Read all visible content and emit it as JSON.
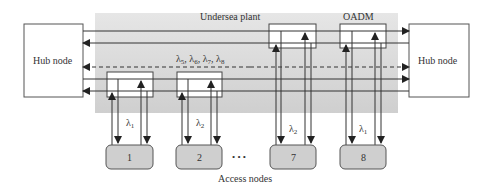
{
  "diagram": {
    "region_label": "Undersea plant",
    "oadm_label": "OADM",
    "hub_left": "Hub node",
    "hub_right": "Hub node",
    "express_wavelengths": "λ5, λ6, λ7, λ8",
    "express_parts": [
      {
        "base": "λ",
        "sub": "5"
      },
      {
        "base": "λ",
        "sub": "6"
      },
      {
        "base": "λ",
        "sub": "7"
      },
      {
        "base": "λ",
        "sub": "8"
      }
    ],
    "access_nodes_label": "Access nodes",
    "ellipsis": "• • •",
    "access_nodes": [
      {
        "id": "1",
        "wavelength_base": "λ",
        "wavelength_sub": "1"
      },
      {
        "id": "2",
        "wavelength_base": "λ",
        "wavelength_sub": "2"
      },
      {
        "id": "7",
        "wavelength_base": "λ",
        "wavelength_sub": "2"
      },
      {
        "id": "8",
        "wavelength_base": "λ",
        "wavelength_sub": "1"
      }
    ],
    "colors": {
      "line": "#333333",
      "node_fill": "#cfcfcf",
      "plant_shade": "#d8d8d8"
    }
  }
}
